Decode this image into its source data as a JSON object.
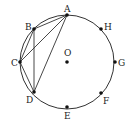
{
  "diagram": {
    "colors": {
      "stroke": "#333333",
      "point": "#111111",
      "text": "#222222"
    },
    "circle": {
      "cx": 67,
      "cy": 62,
      "r": 47
    },
    "center": {
      "label": "O",
      "x": 67,
      "y": 62,
      "lx": 64,
      "ly": 56
    },
    "points": [
      {
        "label": "A",
        "x": 67,
        "y": 15,
        "lx": 64,
        "ly": 12
      },
      {
        "label": "B",
        "x": 34,
        "y": 29,
        "lx": 25,
        "ly": 30
      },
      {
        "label": "C",
        "x": 20,
        "y": 62,
        "lx": 11,
        "ly": 66
      },
      {
        "label": "D",
        "x": 34,
        "y": 92,
        "lx": 26,
        "ly": 103
      },
      {
        "label": "E",
        "x": 67,
        "y": 107,
        "lx": 64,
        "ly": 119
      },
      {
        "label": "F",
        "x": 101,
        "y": 93,
        "lx": 103,
        "ly": 104
      },
      {
        "label": "G",
        "x": 115,
        "y": 62,
        "lx": 118,
        "ly": 66
      },
      {
        "label": "H",
        "x": 101,
        "y": 29,
        "lx": 104,
        "ly": 30
      }
    ],
    "segments": [
      [
        "A",
        "B"
      ],
      [
        "A",
        "C"
      ],
      [
        "A",
        "D"
      ],
      [
        "B",
        "C"
      ],
      [
        "B",
        "D"
      ],
      [
        "C",
        "D"
      ]
    ]
  }
}
